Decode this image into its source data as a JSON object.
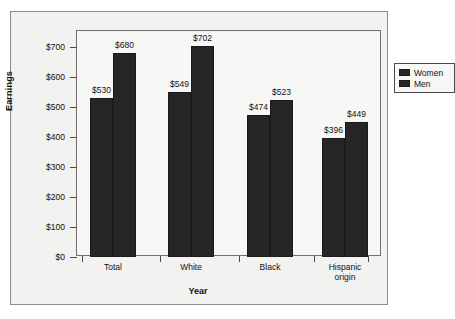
{
  "chart_data": {
    "type": "bar",
    "title": "",
    "xlabel": "Year",
    "ylabel": "Earnings",
    "categories": [
      "Total",
      "White",
      "Black",
      "Hispanic\norigin"
    ],
    "series": [
      {
        "name": "Women",
        "values": [
          530,
          549,
          474,
          396
        ],
        "color": "#262626"
      },
      {
        "name": "Men",
        "values": [
          680,
          702,
          523,
          449
        ],
        "color": "#262626"
      }
    ],
    "data_labels": [
      [
        "$530",
        "$680"
      ],
      [
        "$549",
        "$702"
      ],
      [
        "$474",
        "$523"
      ],
      [
        "$396",
        "$449"
      ]
    ],
    "ylim": [
      0,
      700
    ],
    "yticks": [
      0,
      100,
      200,
      300,
      400,
      500,
      600,
      700
    ],
    "ytick_labels": [
      "$0",
      "$100",
      "$200",
      "$300",
      "$400",
      "$500",
      "$600",
      "$700"
    ],
    "grid": false,
    "legend_position": "top-right",
    "legend_entries": [
      "Women",
      "Men"
    ]
  },
  "legend": {
    "women_label": "Women",
    "men_label": "Men"
  },
  "axes": {
    "y_title": "Earnings",
    "x_title": "Year"
  }
}
